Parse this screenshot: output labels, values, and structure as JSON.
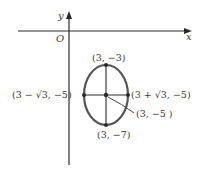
{
  "figure": {
    "type": "ellipse-on-coordinate-axes",
    "axes": {
      "x_label": "x",
      "y_label": "y",
      "origin_label": "O"
    },
    "ellipse": {
      "center": "(3, −5)",
      "vertex_top": "(3, −3)",
      "vertex_bottom": "(3, −7)",
      "covertex_left": "(3 − √3, −5)",
      "covertex_right": "(3 + √3, −5)"
    },
    "labels": {
      "top": "(3,  −3)",
      "bottom": "(3,  −7)",
      "left": "(3 − √3,  −5)",
      "right": "(3 + √3,  −5)",
      "center": "(3,  −5 )"
    },
    "colors": {
      "axis": "#2a2a2a",
      "ellipse": "#555555",
      "text": "#3a3a3a"
    }
  }
}
